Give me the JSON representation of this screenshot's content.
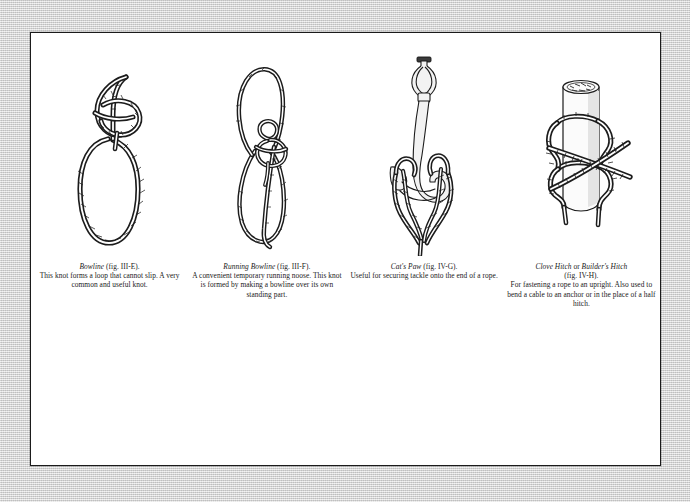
{
  "page": {
    "background_color": "#d3d3d3",
    "paper_color": "#ffffff",
    "border_color": "#1b1b1b",
    "ink_color": "#1c1c1c"
  },
  "plate": {
    "figures": [
      {
        "id": "bowline",
        "icon": "bowline-knot-illustration",
        "title": "Bowline",
        "title_suffix": " (fig. III-E).",
        "description": "This knot forms a loop that cannot slip. A very common and useful knot."
      },
      {
        "id": "running-bowline",
        "icon": "running-bowline-knot-illustration",
        "title": "Running Bowline",
        "title_suffix": " (fig. III-F).",
        "description": "A convenient temporary running noose. This knot is formed by making a bowline over its own standing part."
      },
      {
        "id": "cats-paw",
        "icon": "cats-paw-knot-illustration",
        "title": "Cat's Paw",
        "title_suffix": " (fig. IV-G).",
        "description": "Useful for securing tackle onto the end of a rope."
      },
      {
        "id": "clove-hitch",
        "icon": "clove-hitch-knot-illustration",
        "title": "Clove Hitch",
        "title_mid": " or ",
        "title_alt": "Builder's Hitch",
        "title_suffix": "(fig. IV-H).",
        "description": "For fastening a rope to an upright. Also used to bend a cable to an anchor or in the place of a half hitch."
      }
    ]
  }
}
